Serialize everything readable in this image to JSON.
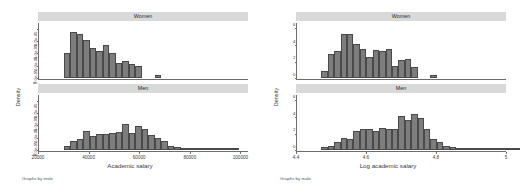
{
  "figures": [
    {
      "id": "left",
      "note": "Graphs by male",
      "chart_ref": 0
    },
    {
      "id": "right",
      "note": "Graphs by male",
      "chart_ref": 1
    }
  ],
  "chart_data": [
    {
      "type": "bar",
      "title": "",
      "xlabel": "Academic salary",
      "ylabel": "Density",
      "xlim": [
        20000,
        103000
      ],
      "xticks": [
        20000,
        40000,
        60000,
        80000,
        100000
      ],
      "xtick_labels": [
        "20000",
        "40000",
        "60000",
        "80000",
        "100000"
      ],
      "grid": false,
      "legend": "none",
      "facets": [
        {
          "label": "Women",
          "ylim": [
            0,
            9e-05
          ],
          "yticks": [
            0,
            2e-05,
            4e-05,
            6e-05,
            8e-05
          ],
          "ytick_labels": [
            "0",
            "2.0e-05",
            "4.0e-05",
            "6.0e-05",
            "8.0e-05"
          ],
          "bin_width": 2600,
          "bins_start": 29500,
          "values": [
            4.05e-05,
            7.6e-05,
            7.2e-05,
            6.3e-05,
            4.9e-05,
            4.5e-05,
            5.4e-05,
            4.2e-05,
            2.55e-05,
            2.9e-05,
            2.35e-05,
            1.95e-05,
            0.0,
            0.0,
            6e-06
          ]
        },
        {
          "label": "Men",
          "ylim": [
            0,
            9e-05
          ],
          "yticks": [
            0,
            2e-05,
            4e-05,
            6e-05,
            8e-05
          ],
          "ytick_labels": [
            "0",
            "2.0e-05",
            "4.0e-05",
            "6.0e-05",
            "8.0e-05"
          ],
          "bin_width": 2600,
          "bins_start": 29500,
          "values": [
            7.5e-06,
            1.55e-05,
            1.85e-05,
            3.2e-05,
            2.25e-05,
            2.6e-05,
            2.65e-05,
            2.85e-05,
            3e-05,
            4.3e-05,
            2.85e-05,
            3.9e-05,
            3.45e-05,
            2.45e-05,
            2e-05,
            1.55e-05,
            7.5e-06,
            6e-06,
            4.5e-06,
            1.5e-06,
            1.5e-06,
            2e-06,
            1e-06,
            2e-06,
            1e-06,
            1.5e-06,
            1e-06
          ]
        }
      ]
    },
    {
      "type": "bar",
      "title": "",
      "xlabel": "Log academic salary",
      "ylabel": "Density",
      "xlim": [
        4.4,
        5.0
      ],
      "xticks": [
        4.4,
        4.6,
        4.8,
        5.0
      ],
      "xtick_labels": [
        "4.4",
        "4.6",
        "4.8",
        "5"
      ],
      "grid": false,
      "legend": "none",
      "facets": [
        {
          "label": "Women",
          "ylim": [
            0,
            6.7
          ],
          "yticks": [
            0,
            2,
            4,
            6
          ],
          "ytick_labels": [
            "0",
            "2",
            "4",
            "6"
          ],
          "bin_width": 0.0185,
          "bins_start": 4.468,
          "values": [
            0.85,
            2.95,
            3.35,
            5.35,
            5.35,
            4.15,
            3.6,
            2.55,
            3.45,
            3.25,
            3.5,
            1.45,
            2.25,
            2.3,
            1.4,
            0.0,
            0.0,
            0.35
          ]
        },
        {
          "label": "Men",
          "ylim": [
            0,
            6.7
          ],
          "yticks": [
            0,
            2,
            4,
            6
          ],
          "ytick_labels": [
            "0",
            "2",
            "4",
            "6"
          ],
          "bin_width": 0.0185,
          "bins_start": 4.468,
          "values": [
            0.45,
            0.55,
            1.05,
            1.55,
            1.35,
            2.3,
            2.55,
            2.55,
            2.3,
            2.7,
            2.55,
            2.55,
            4.15,
            3.7,
            4.35,
            3.9,
            2.55,
            1.35,
            0.95,
            0.55,
            0.4,
            0.3,
            0.2,
            0.15,
            0.1,
            0.08,
            0.05,
            0.05,
            0.04,
            0.03,
            0.1
          ]
        }
      ]
    }
  ]
}
